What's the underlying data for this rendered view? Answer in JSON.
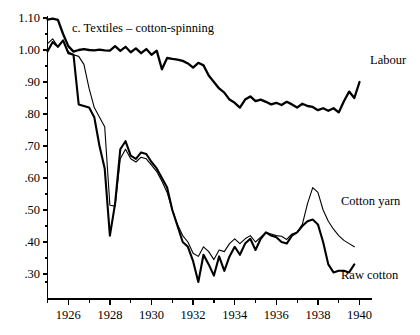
{
  "chart_data": {
    "type": "line",
    "title": "c.  Textiles – cotton-spinning",
    "xlabel": "",
    "ylabel": "",
    "xlim": [
      1925.0,
      1940.6
    ],
    "ylim": [
      0.255,
      1.1
    ],
    "grid": false,
    "legend_position": "inline-right-of-series-end",
    "yticks": [
      "1.10",
      "1.00",
      ".90",
      ".80",
      ".70",
      ".60",
      ".50",
      ".40",
      ".30"
    ],
    "ytick_values": [
      1.1,
      1.0,
      0.9,
      0.8,
      0.7,
      0.6,
      0.5,
      0.4,
      0.3
    ],
    "xticks": [
      "1926",
      "1928",
      "1930",
      "1932",
      "1934",
      "1936",
      "1938",
      "1940"
    ],
    "xtick_values": [
      1926,
      1928,
      1930,
      1932,
      1934,
      1936,
      1938,
      1940
    ],
    "xminor_values": [
      1925,
      1927,
      1929,
      1931,
      1933,
      1935,
      1937,
      1939
    ],
    "series": [
      {
        "name": "Labour",
        "label": "Labour",
        "linewidth": 2.3,
        "x": [
          1925.0,
          1925.25,
          1925.5,
          1925.75,
          1926.0,
          1926.25,
          1926.5,
          1926.75,
          1927.0,
          1927.25,
          1927.5,
          1927.75,
          1928.0,
          1928.25,
          1928.5,
          1928.75,
          1929.0,
          1929.25,
          1929.5,
          1929.75,
          1930.0,
          1930.25,
          1930.5,
          1930.75,
          1931.0,
          1931.25,
          1931.5,
          1931.75,
          1932.0,
          1932.25,
          1932.5,
          1932.75,
          1933.0,
          1933.25,
          1933.5,
          1933.75,
          1934.0,
          1934.25,
          1934.5,
          1934.75,
          1935.0,
          1935.25,
          1935.5,
          1935.75,
          1936.0,
          1936.25,
          1936.5,
          1936.75,
          1937.0,
          1937.25,
          1937.5,
          1937.75,
          1938.0,
          1938.25,
          1938.5,
          1938.75,
          1939.0,
          1939.25,
          1939.5,
          1939.75,
          1940.0
        ],
        "y": [
          1.095,
          1.098,
          1.094,
          1.05,
          1.012,
          0.995,
          1.0,
          1.003,
          1.0,
          0.999,
          1.001,
          0.999,
          0.998,
          1.012,
          0.997,
          1.01,
          0.993,
          1.005,
          0.99,
          1.003,
          0.985,
          0.998,
          0.94,
          0.975,
          0.972,
          0.97,
          0.966,
          0.958,
          0.945,
          0.96,
          0.952,
          0.92,
          0.9,
          0.88,
          0.867,
          0.845,
          0.835,
          0.82,
          0.845,
          0.855,
          0.84,
          0.845,
          0.838,
          0.83,
          0.835,
          0.828,
          0.838,
          0.83,
          0.82,
          0.832,
          0.825,
          0.822,
          0.812,
          0.818,
          0.81,
          0.818,
          0.805,
          0.84,
          0.87,
          0.85,
          0.9
        ]
      },
      {
        "name": "Cotton yarn",
        "label": "Cotton yarn",
        "linewidth": 1.1,
        "x": [
          1925.0,
          1925.25,
          1925.5,
          1925.75,
          1926.0,
          1926.25,
          1926.5,
          1926.75,
          1927.0,
          1927.25,
          1927.5,
          1927.75,
          1928.0,
          1928.25,
          1928.5,
          1928.75,
          1929.0,
          1929.25,
          1929.5,
          1929.75,
          1930.0,
          1930.25,
          1930.5,
          1930.75,
          1931.0,
          1931.25,
          1931.5,
          1931.75,
          1932.0,
          1932.25,
          1932.5,
          1932.75,
          1933.0,
          1933.25,
          1933.5,
          1933.75,
          1934.0,
          1934.25,
          1934.5,
          1934.75,
          1935.0,
          1935.25,
          1935.5,
          1935.75,
          1936.0,
          1936.25,
          1936.5,
          1936.75,
          1937.0,
          1937.25,
          1937.5,
          1937.75,
          1938.0,
          1938.25,
          1938.5,
          1938.75,
          1939.0,
          1939.25,
          1939.5,
          1939.75
        ],
        "y": [
          1.02,
          1.035,
          1.01,
          1.03,
          0.995,
          0.985,
          0.98,
          0.955,
          0.88,
          0.82,
          0.79,
          0.76,
          0.515,
          0.512,
          0.66,
          0.69,
          0.66,
          0.65,
          0.665,
          0.66,
          0.64,
          0.62,
          0.59,
          0.555,
          0.5,
          0.455,
          0.42,
          0.4,
          0.365,
          0.355,
          0.385,
          0.37,
          0.345,
          0.375,
          0.37,
          0.395,
          0.41,
          0.395,
          0.41,
          0.42,
          0.4,
          0.415,
          0.43,
          0.425,
          0.42,
          0.418,
          0.408,
          0.425,
          0.43,
          0.455,
          0.52,
          0.57,
          0.555,
          0.5,
          0.465,
          0.44,
          0.42,
          0.405,
          0.395,
          0.385
        ]
      },
      {
        "name": "Raw cotton",
        "label": "Raw cotton",
        "linewidth": 2.1,
        "x": [
          1925.0,
          1925.25,
          1925.5,
          1925.75,
          1926.0,
          1926.25,
          1926.5,
          1926.75,
          1927.0,
          1927.25,
          1927.5,
          1927.75,
          1928.0,
          1928.25,
          1928.5,
          1928.75,
          1929.0,
          1929.25,
          1929.5,
          1929.75,
          1930.0,
          1930.25,
          1930.5,
          1930.75,
          1931.0,
          1931.25,
          1931.5,
          1931.75,
          1932.0,
          1932.25,
          1932.5,
          1932.75,
          1933.0,
          1933.25,
          1933.5,
          1933.75,
          1934.0,
          1934.25,
          1934.5,
          1934.75,
          1935.0,
          1935.25,
          1935.5,
          1935.75,
          1936.0,
          1936.25,
          1936.5,
          1936.75,
          1937.0,
          1937.25,
          1937.5,
          1937.75,
          1938.0,
          1938.25,
          1938.5,
          1938.75,
          1939.0,
          1939.25,
          1939.5,
          1939.75
        ],
        "y": [
          0.995,
          1.025,
          1.01,
          1.03,
          0.99,
          0.985,
          0.83,
          0.825,
          0.82,
          0.79,
          0.7,
          0.63,
          0.42,
          0.52,
          0.69,
          0.715,
          0.67,
          0.66,
          0.68,
          0.675,
          0.65,
          0.63,
          0.6,
          0.57,
          0.5,
          0.45,
          0.4,
          0.385,
          0.34,
          0.275,
          0.36,
          0.33,
          0.295,
          0.355,
          0.31,
          0.355,
          0.385,
          0.36,
          0.395,
          0.41,
          0.375,
          0.41,
          0.43,
          0.42,
          0.415,
          0.4,
          0.395,
          0.42,
          0.43,
          0.45,
          0.465,
          0.47,
          0.455,
          0.4,
          0.33,
          0.305,
          0.31,
          0.31,
          0.305,
          0.33
        ]
      }
    ]
  },
  "labels": {
    "labour": "Labour",
    "cotton_yarn": "Cotton yarn",
    "raw_cotton": "Raw cotton",
    "title": "c.  Textiles – cotton-spinning"
  },
  "colors": {
    "line": "#000000",
    "axis": "#000000",
    "background": "#ffffff"
  }
}
